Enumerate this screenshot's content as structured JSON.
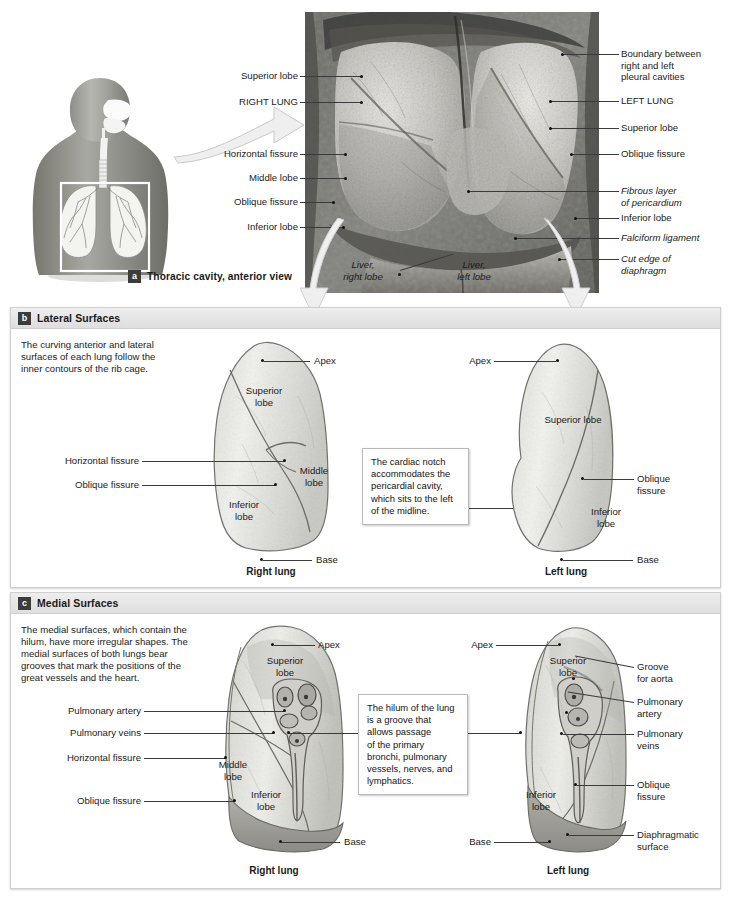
{
  "figure": {
    "panels": [
      {
        "key": "a",
        "badge": "a",
        "title": "Thoracic cavity, anterior view"
      },
      {
        "key": "b",
        "badge": "b",
        "title": "Lateral Surfaces",
        "blurb": "The curving anterior and lateral\nsurfaces of each lung follow the\ninner contours of the rib cage.",
        "callout": "The cardiac notch\naccommodates the\npericardial cavity,\nwhich sits to the left\nof the midline.",
        "left_caption": "Right lung",
        "right_caption": "Left lung"
      },
      {
        "key": "c",
        "badge": "c",
        "title": "Medial Surfaces",
        "blurb": "The medial surfaces, which contain the\nhilum, have more irregular shapes. The\nmedial surfaces of both lungs bear\ngrooves that mark the positions of the\ngreat vessels and the heart.",
        "callout": "The hilum of the lung\nis a groove that\nallows passage\nof the primary\nbronchi, pulmonary\nvessels, nerves, and\nlymphatics.",
        "left_caption": "Right lung",
        "right_caption": "Left lung"
      }
    ]
  },
  "panel_a_labels": {
    "left": [
      {
        "text": "Superior lobe",
        "italic": false
      },
      {
        "text": "RIGHT LUNG",
        "italic": false
      },
      {
        "text": "Horizontal fissure",
        "italic": false
      },
      {
        "text": "Middle lobe",
        "italic": false
      },
      {
        "text": "Oblique fissure",
        "italic": false
      },
      {
        "text": "Inferior lobe",
        "italic": false
      }
    ],
    "right": [
      {
        "text": "Boundary between\nright and left\npleural cavities",
        "italic": false
      },
      {
        "text": "LEFT LUNG",
        "italic": false
      },
      {
        "text": "Superior lobe",
        "italic": false
      },
      {
        "text": "Oblique fissure",
        "italic": false
      },
      {
        "text": "Fibrous layer\nof pericardium",
        "italic": true
      },
      {
        "text": "Inferior lobe",
        "italic": false
      },
      {
        "text": "Falciform ligament",
        "italic": true
      },
      {
        "text": "Cut edge of\ndiaphragm",
        "italic": true
      }
    ],
    "inside": [
      {
        "text": "Liver,\nright lobe",
        "italic": true
      },
      {
        "text": "Liver,\nleft lobe",
        "italic": true
      }
    ]
  },
  "panel_b_labels": {
    "right_lung_on_shape": [
      {
        "text": "Superior\nlobe"
      },
      {
        "text": "Middle\nlobe"
      },
      {
        "text": "Inferior\nlobe"
      }
    ],
    "right_lung_left": [
      {
        "text": "Horizontal fissure"
      },
      {
        "text": "Oblique fissure"
      }
    ],
    "right_lung_right": [
      {
        "text": "Apex"
      },
      {
        "text": "Base"
      }
    ],
    "left_lung_on_shape": [
      {
        "text": "Superior lobe"
      },
      {
        "text": "Inferior\nlobe"
      }
    ],
    "left_lung_left": [
      {
        "text": "Apex"
      }
    ],
    "left_lung_right": [
      {
        "text": "Oblique\nfissure"
      },
      {
        "text": "Base"
      }
    ]
  },
  "panel_c_labels": {
    "right_lung_on_shape": [
      {
        "text": "Superior\nlobe"
      },
      {
        "text": "Middle\nlobe"
      },
      {
        "text": "Inferior\nlobe"
      }
    ],
    "right_lung_left": [
      {
        "text": "Pulmonary artery"
      },
      {
        "text": "Pulmonary veins"
      },
      {
        "text": "Horizontal fissure"
      },
      {
        "text": "Oblique fissure"
      }
    ],
    "right_lung_right": [
      {
        "text": "Apex"
      },
      {
        "text": "Base"
      }
    ],
    "left_lung_on_shape": [
      {
        "text": "Superior\nlobe"
      },
      {
        "text": "Inferior\nlobe"
      }
    ],
    "left_lung_left": [
      {
        "text": "Apex"
      },
      {
        "text": "Base"
      }
    ],
    "left_lung_right": [
      {
        "text": "Groove\nfor aorta"
      },
      {
        "text": "Pulmonary\nartery"
      },
      {
        "text": "Pulmonary\nveins"
      },
      {
        "text": "Oblique\nfissure"
      },
      {
        "text": "Diaphragmatic\nsurface"
      }
    ]
  },
  "colors": {
    "panel_header_bg": "#e4e4e4",
    "badge_bg": "#3c3c3c",
    "leader_line": "#3a3a3a",
    "lung_fill": "#e8e8e6",
    "lung_stroke": "#6f6f6f",
    "callout_border": "#b9b9b9",
    "page_bg": "#ffffff"
  }
}
